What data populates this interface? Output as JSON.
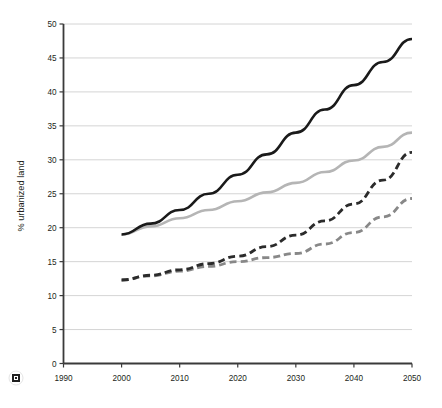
{
  "chart_data": {
    "type": "line",
    "title": "",
    "xlabel": "",
    "ylabel": "% urbanized land",
    "xlim": [
      1990,
      2050
    ],
    "ylim": [
      0,
      50
    ],
    "xticks": [
      "1990",
      "2000",
      "2010",
      "2020",
      "2030",
      "2040",
      "2050"
    ],
    "yticks": [
      "0",
      "5",
      "10",
      "15",
      "20",
      "25",
      "30",
      "35",
      "40",
      "45",
      "50"
    ],
    "grid": true,
    "legend": "none",
    "x": [
      2000,
      2005,
      2010,
      2015,
      2020,
      2025,
      2030,
      2035,
      2040,
      2045,
      2050
    ],
    "series": [
      {
        "name": "black-solid",
        "style": "solid",
        "color": "#1a1a1a",
        "width": 2.6,
        "values": [
          19.0,
          20.6,
          22.6,
          25.0,
          27.8,
          30.8,
          34.0,
          37.4,
          41.0,
          44.4,
          47.8
        ]
      },
      {
        "name": "light-gray-solid",
        "style": "solid",
        "color": "#b5b5b5",
        "width": 2.6,
        "values": [
          19.0,
          20.2,
          21.4,
          22.6,
          23.9,
          25.2,
          26.6,
          28.2,
          29.9,
          31.9,
          34.0
        ]
      },
      {
        "name": "dark-gray-dashed",
        "style": "dashed",
        "color": "#2b2b2b",
        "width": 2.8,
        "dash": "7,4",
        "values": [
          12.3,
          13.0,
          13.8,
          14.7,
          15.8,
          17.2,
          18.9,
          21.0,
          23.5,
          27.0,
          31.1
        ]
      },
      {
        "name": "mid-gray-dashed",
        "style": "dashed",
        "color": "#888888",
        "width": 2.8,
        "dash": "7,4",
        "values": [
          12.3,
          12.9,
          13.6,
          14.3,
          15.0,
          15.6,
          16.2,
          17.6,
          19.3,
          21.6,
          24.3
        ]
      }
    ]
  },
  "footer": {
    "logo_icon": "square-logo-icon"
  }
}
